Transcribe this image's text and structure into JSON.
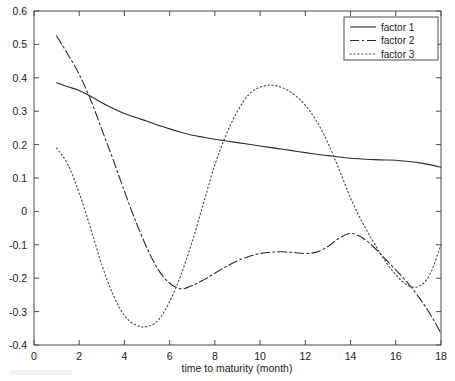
{
  "figure": {
    "background_color": "#ffffff",
    "axis_color": "#4a4a4a",
    "text_color": "#1a1a1a"
  },
  "axes": {
    "xlabel": "time to maturity (month)",
    "ylabel": "",
    "x_ticks": [
      "0",
      "2",
      "4",
      "6",
      "8",
      "10",
      "12",
      "14",
      "16",
      "18"
    ],
    "y_ticks": [
      "-0.4",
      "-0.3",
      "-0.2",
      "-0.1",
      "0",
      "0.1",
      "0.2",
      "0.3",
      "0.4",
      "0.5",
      "0.6"
    ]
  },
  "legend": {
    "position": "top-right",
    "entries": [
      {
        "label": "factor 1",
        "style": "solid"
      },
      {
        "label": "factor 2",
        "style": "dash-dot"
      },
      {
        "label": "factor 3",
        "style": "dotted"
      }
    ]
  },
  "chart_data": {
    "type": "line",
    "title": "",
    "xlabel": "time to maturity (month)",
    "ylabel": "",
    "xlim": [
      0,
      18
    ],
    "ylim": [
      -0.4,
      0.6
    ],
    "xticks": [
      0,
      2,
      4,
      6,
      8,
      10,
      12,
      14,
      16,
      18
    ],
    "yticks": [
      -0.4,
      -0.3,
      -0.2,
      -0.1,
      0,
      0.1,
      0.2,
      0.3,
      0.4,
      0.5,
      0.6
    ],
    "grid": false,
    "legend_position": "upper right",
    "x": [
      1,
      1.5,
      2,
      2.5,
      3,
      3.5,
      4,
      4.5,
      5,
      5.5,
      6,
      6.5,
      7,
      7.5,
      8,
      8.5,
      9,
      9.5,
      10,
      10.5,
      11,
      11.5,
      12,
      12.5,
      13,
      13.5,
      14,
      14.5,
      15,
      15.5,
      16,
      16.5,
      17,
      17.5,
      18
    ],
    "series": [
      {
        "name": "factor 1",
        "style": "solid",
        "color": "#2b2b2b",
        "values": [
          0.385,
          0.373,
          0.362,
          0.345,
          0.325,
          0.308,
          0.293,
          0.281,
          0.27,
          0.258,
          0.247,
          0.237,
          0.228,
          0.222,
          0.216,
          0.211,
          0.206,
          0.201,
          0.196,
          0.191,
          0.186,
          0.181,
          0.176,
          0.171,
          0.167,
          0.163,
          0.159,
          0.157,
          0.155,
          0.154,
          0.153,
          0.15,
          0.146,
          0.14,
          0.132
        ]
      },
      {
        "name": "factor 2",
        "style": "dash-dot",
        "color": "#2b2b2b",
        "values": [
          0.525,
          0.47,
          0.41,
          0.335,
          0.245,
          0.155,
          0.06,
          -0.03,
          -0.11,
          -0.175,
          -0.215,
          -0.232,
          -0.222,
          -0.205,
          -0.185,
          -0.165,
          -0.148,
          -0.135,
          -0.126,
          -0.122,
          -0.121,
          -0.123,
          -0.126,
          -0.122,
          -0.105,
          -0.08,
          -0.066,
          -0.078,
          -0.105,
          -0.14,
          -0.175,
          -0.212,
          -0.255,
          -0.305,
          -0.365
        ]
      },
      {
        "name": "factor 3",
        "style": "dotted",
        "color": "#4a4a4a",
        "values": [
          0.19,
          0.14,
          0.055,
          -0.05,
          -0.16,
          -0.25,
          -0.312,
          -0.34,
          -0.345,
          -0.325,
          -0.27,
          -0.19,
          -0.09,
          0.025,
          0.14,
          0.23,
          0.3,
          0.35,
          0.372,
          0.378,
          0.37,
          0.35,
          0.318,
          0.27,
          0.205,
          0.125,
          0.04,
          -0.03,
          -0.09,
          -0.145,
          -0.19,
          -0.22,
          -0.225,
          -0.19,
          -0.1
        ]
      }
    ]
  }
}
